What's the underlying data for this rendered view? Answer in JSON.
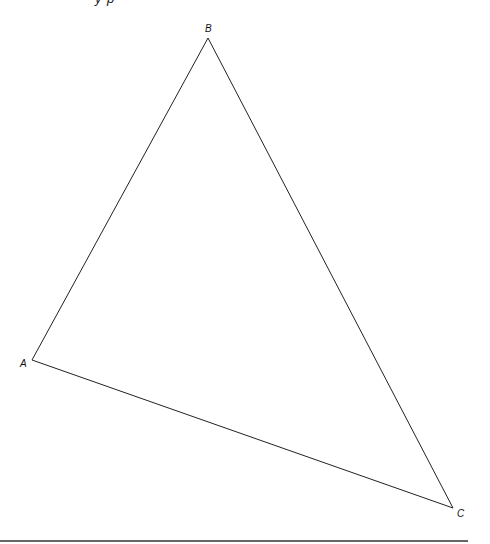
{
  "figure": {
    "top_clipped_text": "y p",
    "triangle": {
      "stroke_color": "#222222",
      "vertices": [
        {
          "label": "A",
          "x": 32,
          "y": 360,
          "label_x": 20,
          "label_y": 367
        },
        {
          "label": "B",
          "x": 208,
          "y": 38,
          "label_x": 205,
          "label_y": 32
        },
        {
          "label": "C",
          "x": 453,
          "y": 508,
          "label_x": 457,
          "label_y": 517
        }
      ]
    },
    "bottom_rule": {
      "x1": 0,
      "x2": 468,
      "y": 541,
      "color": "#333333"
    }
  }
}
